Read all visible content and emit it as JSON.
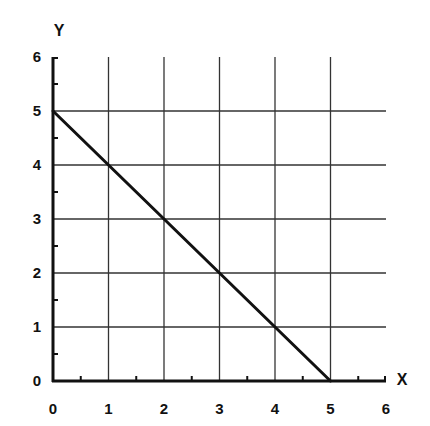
{
  "chart_data": {
    "type": "line",
    "title": "",
    "xlabel": "X",
    "ylabel": "Y",
    "xlim": [
      0,
      6
    ],
    "ylim": [
      0,
      6
    ],
    "x_ticks": [
      "0",
      "1",
      "2",
      "3",
      "4",
      "5",
      "6"
    ],
    "y_ticks": [
      "0",
      "1",
      "2",
      "3",
      "4",
      "5",
      "6"
    ],
    "minor_ticks": "every 0.5 unit on both axes",
    "grid": true,
    "legend": null,
    "series": [
      {
        "name": "line",
        "x": [
          0,
          1,
          2,
          3,
          4,
          5
        ],
        "y": [
          5,
          4,
          3,
          2,
          1,
          0
        ],
        "color": "#111111"
      }
    ]
  },
  "colors": {
    "background": "#ffffff",
    "axis": "#111111",
    "grid": "#333333",
    "series": "#111111"
  }
}
